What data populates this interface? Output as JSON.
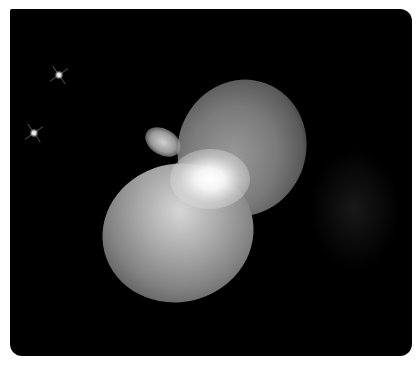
{
  "image": {
    "subject": "bipolar nebula",
    "alt": "Bipolar nebula with two lobes and a bright central star, with two small stars in the upper left",
    "colors": {
      "background": "#000000",
      "page": "#ffffff",
      "lobe": "#b8b8b8",
      "core": "#ffffff"
    },
    "stars": [
      {
        "x": 49,
        "y": 66
      },
      {
        "x": 24,
        "y": 124
      }
    ]
  }
}
